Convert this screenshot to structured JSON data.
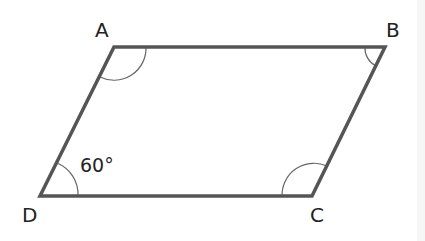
{
  "diagram": {
    "type": "parallelogram",
    "vertices": {
      "A": {
        "label": "A",
        "x": 114,
        "y": 47
      },
      "B": {
        "label": "B",
        "x": 385,
        "y": 47
      },
      "C": {
        "label": "C",
        "x": 312,
        "y": 196
      },
      "D": {
        "label": "D",
        "x": 40,
        "y": 196
      }
    },
    "angle_labels": {
      "D": "60°"
    },
    "colors": {
      "stroke": "#555555",
      "text": "#222222",
      "background": "#ffffff"
    }
  }
}
